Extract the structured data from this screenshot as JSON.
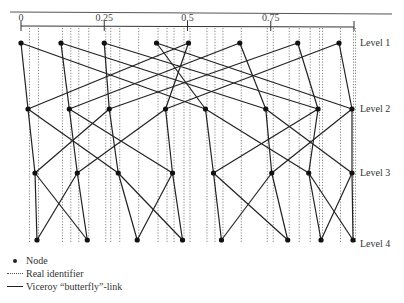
{
  "axis": {
    "ticks": [
      {
        "value": 0,
        "label": "0"
      },
      {
        "value": 0.25,
        "label": "0.25"
      },
      {
        "value": 0.5,
        "label": "0.5"
      },
      {
        "value": 0.75,
        "label": "0.75"
      },
      {
        "value": 1,
        "label": ""
      }
    ]
  },
  "levels": [
    {
      "label": "Level 1",
      "nodes": [
        0.0,
        0.12,
        0.25,
        0.407,
        0.503,
        0.657,
        0.831,
        0.955
      ]
    },
    {
      "label": "Level 2",
      "nodes": [
        0.021,
        0.145,
        0.265,
        0.434,
        0.554,
        0.735,
        0.892,
        0.994
      ]
    },
    {
      "label": "Level 3",
      "nodes": [
        0.042,
        0.169,
        0.292,
        0.455,
        0.578,
        0.753,
        0.864,
        0.994
      ]
    },
    {
      "label": "Level 4",
      "nodes": [
        0.048,
        0.199,
        0.349,
        0.485,
        0.602,
        0.801,
        0.901,
        0.997
      ]
    }
  ],
  "real_identifiers": [
    0.021,
    0.048,
    0.12,
    0.145,
    0.169,
    0.199,
    0.25,
    0.265,
    0.292,
    0.349,
    0.407,
    0.434,
    0.455,
    0.485,
    0.503,
    0.554,
    0.578,
    0.602,
    0.657,
    0.735,
    0.753,
    0.801,
    0.831,
    0.864,
    0.892,
    0.901,
    0.955,
    0.994,
    1.0
  ],
  "links": [
    [
      0,
      0,
      1,
      0
    ],
    [
      0,
      0,
      1,
      4
    ],
    [
      0,
      1,
      1,
      1
    ],
    [
      0,
      1,
      1,
      5
    ],
    [
      0,
      2,
      1,
      2
    ],
    [
      0,
      2,
      1,
      6
    ],
    [
      0,
      3,
      1,
      4
    ],
    [
      0,
      3,
      1,
      7
    ],
    [
      0,
      4,
      1,
      3
    ],
    [
      0,
      4,
      1,
      0
    ],
    [
      0,
      5,
      1,
      5
    ],
    [
      0,
      5,
      1,
      1
    ],
    [
      0,
      6,
      1,
      6
    ],
    [
      0,
      6,
      1,
      2
    ],
    [
      0,
      7,
      1,
      7
    ],
    [
      0,
      7,
      1,
      3
    ],
    [
      1,
      0,
      2,
      0
    ],
    [
      1,
      0,
      2,
      2
    ],
    [
      1,
      1,
      2,
      1
    ],
    [
      1,
      1,
      2,
      3
    ],
    [
      1,
      2,
      2,
      2
    ],
    [
      1,
      2,
      2,
      0
    ],
    [
      1,
      3,
      2,
      3
    ],
    [
      1,
      3,
      2,
      1
    ],
    [
      1,
      4,
      2,
      4
    ],
    [
      1,
      4,
      2,
      6
    ],
    [
      1,
      5,
      2,
      5
    ],
    [
      1,
      5,
      2,
      7
    ],
    [
      1,
      6,
      2,
      6
    ],
    [
      1,
      6,
      2,
      4
    ],
    [
      1,
      7,
      2,
      7
    ],
    [
      1,
      7,
      2,
      5
    ],
    [
      2,
      0,
      3,
      0
    ],
    [
      2,
      0,
      3,
      1
    ],
    [
      2,
      1,
      3,
      1
    ],
    [
      2,
      1,
      3,
      0
    ],
    [
      2,
      2,
      3,
      2
    ],
    [
      2,
      2,
      3,
      3
    ],
    [
      2,
      3,
      3,
      3
    ],
    [
      2,
      3,
      3,
      2
    ],
    [
      2,
      4,
      3,
      4
    ],
    [
      2,
      4,
      3,
      5
    ],
    [
      2,
      5,
      3,
      5
    ],
    [
      2,
      5,
      3,
      4
    ],
    [
      2,
      6,
      3,
      6
    ],
    [
      2,
      6,
      3,
      7
    ],
    [
      2,
      7,
      3,
      7
    ],
    [
      2,
      7,
      3,
      6
    ]
  ],
  "legend": {
    "node": "Node",
    "real_identifier": "Real identifier",
    "link": "Viceroy “butterfly”-link"
  }
}
